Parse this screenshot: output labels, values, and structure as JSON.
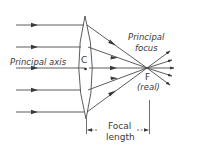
{
  "diagram": {
    "labels": {
      "principal_axis": "Principal axis",
      "optical_centre": "C",
      "principal_focus_line1": "Principal",
      "principal_focus_line2": "focus",
      "focus_point": "F",
      "focus_type": "(real)",
      "focal_length_line1": "Focal",
      "focal_length_line2": "length"
    },
    "rays": {
      "count": 5,
      "incoming_y": [
        25,
        47,
        68,
        90,
        112
      ]
    },
    "colors": {
      "line": "#4a4a4a",
      "text": "#3a3a3a",
      "background": "#ffffff"
    }
  }
}
